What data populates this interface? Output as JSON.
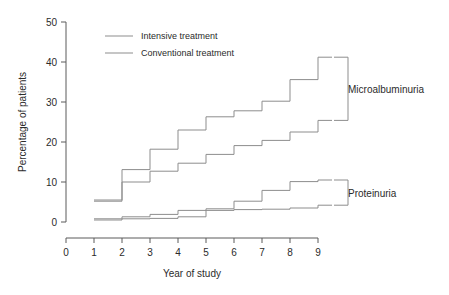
{
  "chart_data": {
    "type": "line",
    "subtype": "step",
    "title": "",
    "xlabel": "Year of study",
    "ylabel": "Percentage of patients",
    "xlim": [
      0,
      9.5
    ],
    "ylim": [
      0,
      50
    ],
    "xticks": [
      0,
      1,
      2,
      3,
      4,
      5,
      6,
      7,
      8,
      9
    ],
    "xticklabels": [
      "0",
      "1",
      "2",
      "3",
      "4",
      "5",
      "6",
      "7",
      "8",
      "9"
    ],
    "yticks": [
      0,
      10,
      20,
      30,
      40,
      50
    ],
    "yticklabels": [
      "0",
      "10",
      "20",
      "30",
      "40",
      "50"
    ],
    "grid": false,
    "legend_position": "top-left",
    "x": [
      1,
      2,
      3,
      4,
      5,
      6,
      7,
      8,
      9,
      9.5
    ],
    "series": [
      {
        "name": "Microalbuminuria - Conventional treatment",
        "group": "Microalbuminuria",
        "treatment": "Conventional treatment",
        "color": "#8d8d8d",
        "values": [
          5.5,
          13.1,
          18.2,
          23.0,
          26.3,
          27.8,
          30.2,
          35.6,
          41.2,
          41.2
        ]
      },
      {
        "name": "Microalbuminuria - Intensive treatment",
        "group": "Microalbuminuria",
        "treatment": "Intensive treatment",
        "color": "#8d8d8d",
        "values": [
          5.2,
          10.0,
          12.7,
          14.7,
          16.9,
          19.1,
          20.4,
          22.5,
          25.4,
          25.4
        ]
      },
      {
        "name": "Proteinuria - Conventional treatment",
        "group": "Proteinuria",
        "treatment": "Conventional treatment",
        "color": "#8d8d8d",
        "values": [
          0.8,
          1.3,
          1.9,
          2.9,
          3.3,
          5.2,
          7.9,
          10.1,
          10.5,
          10.5
        ]
      },
      {
        "name": "Proteinuria - Intensive treatment",
        "group": "Proteinuria",
        "treatment": "Intensive treatment",
        "color": "#8d8d8d",
        "values": [
          0.5,
          0.8,
          0.9,
          1.3,
          2.9,
          3.1,
          3.2,
          3.5,
          4.2,
          4.2
        ]
      }
    ],
    "annotations": [
      {
        "name": "Microalbuminuria",
        "bracket_top": 41.2,
        "bracket_bottom": 25.4
      },
      {
        "name": "Proteinuria",
        "bracket_top": 10.5,
        "bracket_bottom": 4.2
      }
    ]
  },
  "axes": {
    "ylabel": "Percentage of patients",
    "xlabel": "Year of study",
    "yticklabels": [
      "50",
      "40",
      "30",
      "20",
      "10",
      "0"
    ],
    "xticklabels": [
      "0",
      "1",
      "2",
      "3",
      "4",
      "5",
      "6",
      "7",
      "8",
      "9"
    ]
  },
  "legend": {
    "items": [
      {
        "label": "Intensive treatment",
        "color": "#8d8d8d"
      },
      {
        "label": "Conventional treatment",
        "color": "#8d8d8d"
      }
    ]
  },
  "group_labels": {
    "micro": "Microalbuminuria",
    "protein": "Proteinuria"
  }
}
